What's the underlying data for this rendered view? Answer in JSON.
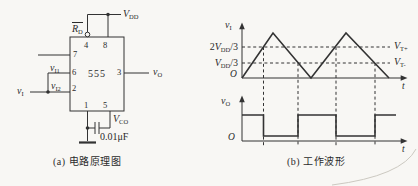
{
  "figure": {
    "circuit": {
      "caption": "(a) 电路原理图",
      "chip": "555",
      "pins": {
        "p1": "1",
        "p2": "2",
        "p3": "3",
        "p4": "4",
        "p5": "5",
        "p6": "6",
        "p7": "7",
        "p8": "8"
      },
      "labels": {
        "vdd": {
          "base": "V",
          "sub": "DD"
        },
        "rd": {
          "base": "R",
          "sub": "D"
        },
        "vi1": {
          "base": "v",
          "sub": "I1"
        },
        "vi2": {
          "base": "v",
          "sub": "I2"
        },
        "vi": {
          "base": "v",
          "sub": "I"
        },
        "vo": {
          "base": "v",
          "sub": "O"
        },
        "vco": {
          "base": "V",
          "sub": "CO"
        },
        "cap_value": "0.01μF"
      }
    },
    "waveforms": {
      "caption": "(b) 工作波形",
      "vi_plot": {
        "axis": {
          "base": "v",
          "sub": "I"
        },
        "origin": "O",
        "t": "t",
        "ticks": [
          {
            "pre": "2",
            "base": "V",
            "sub": "DD",
            "post": "/3"
          },
          {
            "pre": "",
            "base": "V",
            "sub": "DD",
            "post": "/3"
          }
        ],
        "right_labels": [
          {
            "base": "V",
            "sub": "T+"
          },
          {
            "base": "V",
            "sub": "T-"
          }
        ],
        "points": "242,78 273,33 311,78 346,33 389,78"
      },
      "vo_plot": {
        "axis": {
          "base": "v",
          "sub": "O"
        },
        "origin": "O",
        "t": "t",
        "points": "242,115 263.5,115 263.5,136 298,136 298,115 336,115 336,136 375,136 375,115 396,115"
      },
      "threshold_crossings_x": [
        263.5,
        298,
        336,
        375
      ],
      "threshold_levels_y": {
        "vt_plus": 47,
        "vt_minus": 63
      }
    },
    "colors": {
      "ink": "#333333",
      "paper": "#f8f7f4",
      "page_edge": "#ccc9c1"
    }
  }
}
